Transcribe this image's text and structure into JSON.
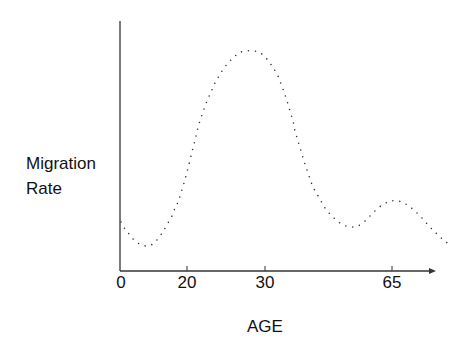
{
  "chart_data": {
    "type": "line",
    "title": "",
    "xlabel": "AGE",
    "ylabel": "Migration Rate",
    "x_ticks": [
      0,
      20,
      30,
      65
    ],
    "y_ticks": [],
    "grid": false,
    "legend": null,
    "style": "dotted curve, schematic (no y scale)",
    "series": [
      {
        "name": "Migration Rate",
        "x": [
          0,
          3,
          6,
          10,
          14,
          18,
          20,
          23,
          26,
          28,
          30,
          33,
          36,
          40,
          45,
          50,
          55,
          60,
          65,
          68,
          72,
          76,
          80
        ],
        "values": [
          49,
          35,
          25,
          50,
          130,
          175,
          195,
          210,
          218,
          220,
          215,
          180,
          130,
          85,
          52,
          45,
          48,
          62,
          70,
          65,
          50,
          38,
          28
        ]
      }
    ],
    "annotations": []
  },
  "axes": {
    "origin_px": [
      120,
      271
    ],
    "y_top_px": 21,
    "x_end_px": 436,
    "ticks_px": [
      {
        "label": "0",
        "x": 121
      },
      {
        "label": "20",
        "x": 187
      },
      {
        "label": "30",
        "x": 265
      },
      {
        "label": "65",
        "x": 392
      }
    ]
  },
  "curve_points_px": [
    [
      121,
      222
    ],
    [
      125,
      229
    ],
    [
      130,
      235
    ],
    [
      135,
      241
    ],
    [
      142,
      245
    ],
    [
      149,
      246
    ],
    [
      155,
      242
    ],
    [
      160,
      236
    ],
    [
      164,
      230
    ],
    [
      168,
      223
    ],
    [
      172,
      216
    ],
    [
      175,
      208
    ],
    [
      178,
      202
    ],
    [
      181,
      193
    ],
    [
      184,
      183
    ],
    [
      187,
      172
    ],
    [
      190,
      160
    ],
    [
      193,
      148
    ],
    [
      196,
      136
    ],
    [
      199,
      124
    ],
    [
      203,
      112
    ],
    [
      207,
      101
    ],
    [
      211,
      92
    ],
    [
      215,
      83
    ],
    [
      219,
      76
    ],
    [
      224,
      68
    ],
    [
      229,
      62
    ],
    [
      234,
      57
    ],
    [
      239,
      53
    ],
    [
      245,
      51
    ],
    [
      252,
      51
    ],
    [
      259,
      52
    ],
    [
      265,
      57
    ],
    [
      270,
      63
    ],
    [
      274,
      69
    ],
    [
      278,
      76
    ],
    [
      281,
      84
    ],
    [
      284,
      92
    ],
    [
      287,
      101
    ],
    [
      290,
      111
    ],
    [
      293,
      121
    ],
    [
      295,
      131
    ],
    [
      298,
      141
    ],
    [
      301,
      151
    ],
    [
      304,
      161
    ],
    [
      307,
      170
    ],
    [
      310,
      179
    ],
    [
      313,
      187
    ],
    [
      317,
      194
    ],
    [
      321,
      201
    ],
    [
      325,
      208
    ],
    [
      330,
      214
    ],
    [
      335,
      219
    ],
    [
      340,
      223
    ],
    [
      346,
      226
    ],
    [
      352,
      227
    ],
    [
      358,
      226
    ],
    [
      364,
      222
    ],
    [
      370,
      216
    ],
    [
      377,
      209
    ],
    [
      384,
      204
    ],
    [
      391,
      201
    ],
    [
      398,
      201
    ],
    [
      404,
      203
    ],
    [
      410,
      207
    ],
    [
      416,
      212
    ],
    [
      422,
      218
    ],
    [
      428,
      225
    ],
    [
      434,
      231
    ],
    [
      440,
      237
    ],
    [
      446,
      242
    ],
    [
      451,
      246
    ]
  ],
  "labels": {
    "y_line1": "Migration",
    "y_line2": "Rate",
    "x": "AGE"
  },
  "colors": {
    "axis": "#333333",
    "dots": "#333333",
    "text": "#111111",
    "background": "#ffffff"
  }
}
